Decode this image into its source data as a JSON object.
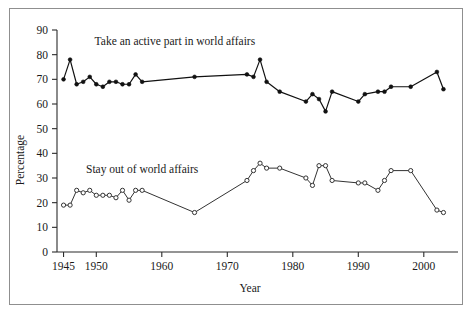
{
  "figure": {
    "border_color": "#8f8f8f",
    "background": "#ffffff"
  },
  "chart_data": {
    "type": "line",
    "title": "",
    "xlabel": "Year",
    "ylabel": "Percentage",
    "xlim": [
      1944,
      2004
    ],
    "ylim": [
      0,
      90
    ],
    "grid": false,
    "legend_position": "inline-annotation",
    "xticks": [
      1945,
      1950,
      1960,
      1970,
      1980,
      1990,
      2000
    ],
    "xtick_labels": [
      "1945",
      "1950",
      "1960",
      "1970",
      "1980",
      "1990",
      "2000"
    ],
    "yticks": [
      0,
      10,
      20,
      30,
      40,
      50,
      60,
      70,
      80,
      90
    ],
    "ytick_labels": [
      "0",
      "10",
      "20",
      "30",
      "40",
      "50",
      "60",
      "70",
      "80",
      "90"
    ],
    "annotations": [
      {
        "text": "Take an active part in world affairs",
        "x": 1962,
        "y": 84,
        "series": "active"
      },
      {
        "text": "Stay out of world affairs",
        "x": 1957,
        "y": 32,
        "series": "stayout"
      }
    ],
    "series": [
      {
        "name": "Take an active part in world affairs",
        "marker": "filled-circle",
        "color": "#111111",
        "x": [
          1945,
          1946,
          1947,
          1948,
          1949,
          1950,
          1951,
          1952,
          1953,
          1954,
          1955,
          1956,
          1957,
          1965,
          1973,
          1974,
          1975,
          1976,
          1978,
          1982,
          1983,
          1984,
          1985,
          1986,
          1990,
          1991,
          1993,
          1994,
          1995,
          1998,
          2002,
          2003
        ],
        "values": [
          70,
          78,
          68,
          69,
          71,
          68,
          67,
          69,
          69,
          68,
          68,
          72,
          69,
          71,
          72,
          71,
          78,
          69,
          65,
          61,
          64,
          62,
          57,
          65,
          61,
          64,
          65,
          65,
          67,
          67,
          73,
          66
        ],
        "y": [
          70,
          78,
          68,
          69,
          71,
          68,
          67,
          69,
          69,
          68,
          68,
          72,
          69,
          71,
          72,
          71,
          78,
          69,
          65,
          61,
          64,
          62,
          57,
          65,
          61,
          64,
          65,
          65,
          67,
          67,
          73,
          66
        ]
      },
      {
        "name": "Stay out of world affairs",
        "marker": "open-circle",
        "color": "#333333",
        "x": [
          1945,
          1946,
          1947,
          1948,
          1949,
          1950,
          1951,
          1952,
          1953,
          1954,
          1955,
          1956,
          1957,
          1965,
          1973,
          1974,
          1975,
          1976,
          1978,
          1982,
          1983,
          1984,
          1985,
          1986,
          1990,
          1991,
          1993,
          1994,
          1995,
          1998,
          2002,
          2003
        ],
        "values": [
          19,
          19,
          25,
          24,
          25,
          23,
          23,
          23,
          22,
          25,
          21,
          25,
          25,
          16,
          29,
          33,
          36,
          34,
          34,
          30,
          27,
          35,
          35,
          29,
          28,
          28,
          25,
          29,
          33,
          33,
          17,
          16
        ],
        "y": [
          19,
          19,
          25,
          24,
          25,
          23,
          23,
          23,
          22,
          25,
          21,
          25,
          25,
          16,
          29,
          33,
          36,
          34,
          34,
          30,
          27,
          35,
          35,
          29,
          28,
          28,
          25,
          29,
          33,
          33,
          17,
          16
        ]
      }
    ]
  }
}
